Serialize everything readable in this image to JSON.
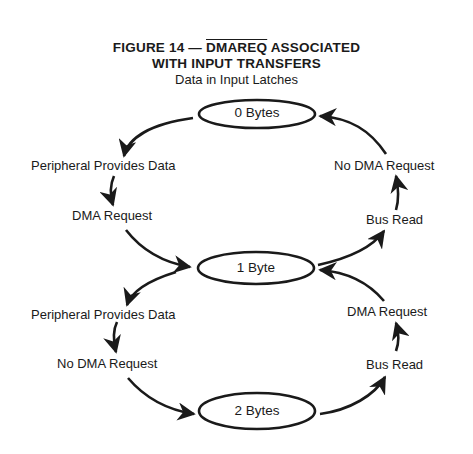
{
  "figure": {
    "title_prefix": "FIGURE 14 — ",
    "title_signal": "DMAREQ",
    "title_suffix": " ASSOCIATED",
    "title_line2": "WITH INPUT TRANSFERS",
    "subtitle": "Data in Input Latches"
  },
  "nodes": [
    {
      "id": "zero",
      "label": "0 Bytes"
    },
    {
      "id": "one",
      "label": "1 Byte"
    },
    {
      "id": "two",
      "label": "2 Bytes"
    }
  ],
  "edges": {
    "left_top_1": "Peripheral Provides Data",
    "left_top_2": "DMA Request",
    "left_bottom_1": "Peripheral Provides Data",
    "left_bottom_2": "No DMA Request",
    "right_top_1": "No DMA Request",
    "right_top_2": "Bus Read",
    "right_bottom_1": "DMA Request",
    "right_bottom_2": "Bus Read"
  },
  "colors": {
    "ink": "#1a1a1a",
    "background": "#ffffff"
  }
}
